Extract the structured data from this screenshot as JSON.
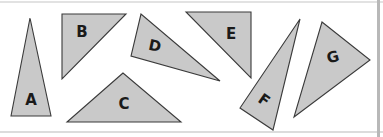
{
  "diagram": {
    "colors": {
      "fill": "#c9c9c9",
      "stroke": "#3a3a3a",
      "label": "#1a1a1a",
      "background": "#ffffff"
    },
    "triangles": [
      {
        "label": "A",
        "points": "30,18 11,116 51,116",
        "label_pos": [
          31,
          100
        ],
        "label_rotate": 0
      },
      {
        "label": "B",
        "points": "62,14 126,14 62,79",
        "label_pos": [
          82,
          32
        ],
        "label_rotate": 0
      },
      {
        "label": "C",
        "points": "123,73 67,122 181,122",
        "label_pos": [
          124,
          104
        ],
        "label_rotate": 0
      },
      {
        "label": "D",
        "points": "141,14 131,56 220,81",
        "label_pos": [
          155,
          46
        ],
        "label_rotate": 12
      },
      {
        "label": "E",
        "points": "186,12 251,12 251,78",
        "label_pos": [
          231,
          34
        ],
        "label_rotate": 0
      },
      {
        "label": "F",
        "points": "300,19 240,108 273,130",
        "label_pos": [
          264,
          100
        ],
        "label_rotate": 35
      },
      {
        "label": "G",
        "points": "322,22 370,60 294,117",
        "label_pos": [
          333,
          57
        ],
        "label_rotate": -15
      }
    ]
  }
}
